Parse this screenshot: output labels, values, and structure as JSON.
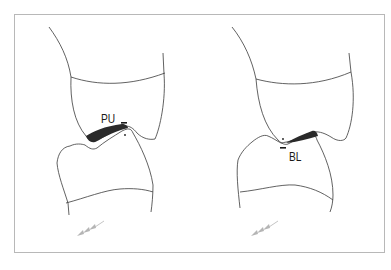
{
  "figure": {
    "panels": [
      {
        "id": "left",
        "label": "PU",
        "description": "upper tooth over lower tooth, contact shaded on left side of contact point"
      },
      {
        "id": "right",
        "label": "BL",
        "description": "upper tooth over lower tooth, contact shaded on right side of contact point"
      }
    ],
    "colors": {
      "outline": "#3a3a3a",
      "shade": "#2a2a2a",
      "arrow": "#b5b5b5",
      "frame": "#b8b8b8"
    }
  }
}
